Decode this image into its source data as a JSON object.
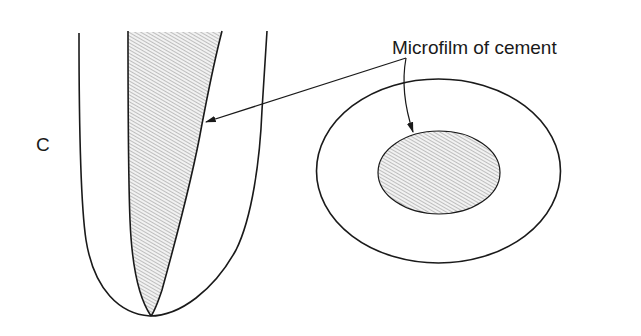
{
  "figure": {
    "panel_label": "C",
    "annotation": "Microfilm of cement",
    "parts": {
      "longitudinal_section": "tooth-root-longitudinal-section",
      "cross_section": "tooth-root-cross-section"
    }
  },
  "colors": {
    "stroke": "#1a1a1a",
    "hatch": "#8a8a8a",
    "hatch_bg": "#f2f2f2",
    "background": "#ffffff"
  }
}
